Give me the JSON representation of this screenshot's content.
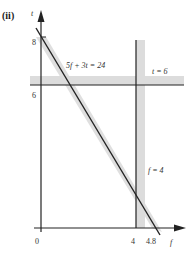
{
  "panel_label": "(ii)",
  "axes": {
    "x_label": "f",
    "y_label": "t",
    "origin_label": "0",
    "x_ticks": [
      "4",
      "4.8"
    ],
    "y_ticks": [
      "8",
      "6"
    ]
  },
  "lines": [
    {
      "label": "5f + 3t = 24",
      "type": "diagonal"
    },
    {
      "label": "t = 6",
      "type": "horizontal"
    },
    {
      "label": "f = 4",
      "type": "vertical"
    }
  ],
  "colors": {
    "line": "#222222",
    "shade": "#d9d9d9"
  }
}
